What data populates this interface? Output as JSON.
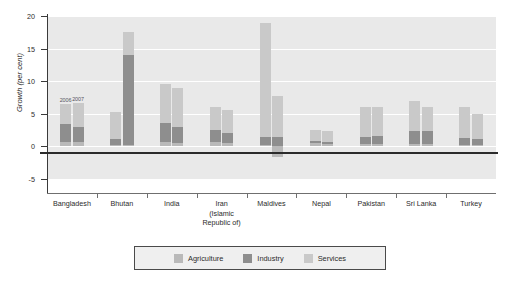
{
  "chart_data": {
    "type": "bar",
    "title": "",
    "subtitle": "",
    "xlabel": "",
    "ylabel": "Growth (per cent)",
    "ylim": [
      -5,
      20
    ],
    "yticks": [
      -5,
      0,
      5,
      10,
      15,
      20
    ],
    "ytick_labels": [
      "-5",
      "0",
      "5",
      "10",
      "15",
      "20"
    ],
    "grid": true,
    "stacked": true,
    "legend_position": "bottom",
    "legend": [
      "Agriculture",
      "Industry",
      "Services"
    ],
    "annotations": [
      "2006",
      "2007"
    ],
    "categories": [
      "Bangladesh",
      "Bhutan",
      "India",
      "Iran\n(Islamic\nRepublic of)",
      "Maldives",
      "Nepal",
      "Pakistan",
      "Sri Lanka",
      "Turkey"
    ],
    "category_lines": [
      [
        "Bangladesh"
      ],
      [
        "Bhutan"
      ],
      [
        "India"
      ],
      [
        "Iran",
        "(Islamic",
        "Republic of)"
      ],
      [
        "Maldives"
      ],
      [
        "Nepal"
      ],
      [
        "Pakistan"
      ],
      [
        "Sri Lanka"
      ],
      [
        "Turkey"
      ]
    ],
    "years": [
      "2006",
      "2007"
    ],
    "series": [
      {
        "name": "Agriculture",
        "color": "#b9b9b9",
        "values_2006": [
          0.7,
          0.2,
          0.6,
          0.6,
          0.2,
          0.5,
          0.3,
          0.4,
          0.2
        ],
        "values_2007": [
          0.6,
          0.2,
          0.5,
          0.5,
          -1.6,
          0.4,
          0.3,
          0.4,
          0.2
        ]
      },
      {
        "name": "Industry",
        "color": "#8e8e8e",
        "values_2006": [
          2.8,
          0.9,
          3.0,
          1.9,
          1.3,
          0.3,
          1.2,
          2.0,
          1.1
        ],
        "values_2007": [
          2.4,
          13.8,
          2.5,
          1.6,
          1.4,
          0.3,
          1.3,
          2.0,
          1.0
        ]
      },
      {
        "name": "Services",
        "color": "#c9c9c9",
        "values_2006": [
          3.0,
          4.2,
          6.0,
          3.5,
          17.5,
          1.7,
          4.5,
          4.6,
          4.7
        ],
        "values_2007": [
          3.6,
          3.5,
          5.9,
          3.5,
          6.4,
          1.6,
          4.4,
          3.6,
          3.8
        ]
      }
    ],
    "totals_2006": [
      6.5,
      5.3,
      9.6,
      6.0,
      19.0,
      2.5,
      6.0,
      7.0,
      6.0
    ],
    "totals_2007": [
      6.6,
      17.5,
      8.9,
      5.6,
      8.2,
      2.3,
      6.0,
      6.0,
      5.0
    ]
  },
  "source_note": ""
}
